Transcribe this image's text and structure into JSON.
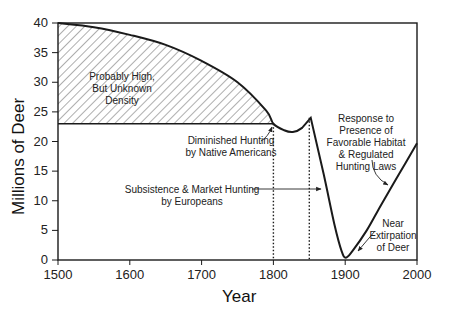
{
  "chart_data": {
    "type": "line",
    "title": "",
    "xlabel": "Year",
    "ylabel": "Millions of Deer",
    "xlim": [
      1500,
      2000
    ],
    "ylim": [
      0,
      40
    ],
    "x_ticks": [
      1500,
      1600,
      1700,
      1800,
      1900,
      2000
    ],
    "y_ticks": [
      0,
      5,
      10,
      15,
      20,
      25,
      30,
      35,
      40
    ],
    "grid": false,
    "series": [
      {
        "name": "Deer population",
        "x": [
          1500,
          1550,
          1600,
          1650,
          1700,
          1750,
          1790,
          1800,
          1815,
          1827,
          1840,
          1852,
          1870,
          1885,
          1895,
          1901,
          1910,
          1930,
          1950,
          1975,
          2000
        ],
        "values": [
          40,
          39.3,
          38,
          36.3,
          33.6,
          30,
          25.2,
          23,
          21.9,
          21.6,
          22.3,
          24,
          14.5,
          6,
          1.5,
          0.4,
          1.5,
          5,
          9.3,
          14.5,
          19.7
        ]
      },
      {
        "name": "Unknown-density upper bound (hatched region)",
        "x": [
          1500,
          1800
        ],
        "values": [
          23,
          23
        ]
      }
    ],
    "shaded_region": {
      "label": "Probably High, But Unknown Density",
      "x_range": [
        1500,
        1800
      ],
      "lower": 23,
      "upper": "population curve"
    },
    "vertical_markers": [
      1800,
      1850
    ],
    "annotations": [
      {
        "text": "Probably High, But Unknown Density",
        "lines": [
          "Probably High,",
          "But Unknown",
          "Density"
        ]
      },
      {
        "text": "Diminished Hunting by Native Americans",
        "lines": [
          "Diminished Hunting",
          "by Native Americans"
        ],
        "points_to_year": 1800
      },
      {
        "text": "Subsistence & Market Hunting by Europeans",
        "lines": [
          "Subsistence & Market Hunting",
          "by Europeans"
        ],
        "points_to_year": 1870
      },
      {
        "text": "Response to Presence of Favorable Habitat & Regulated Hunting Laws",
        "lines": [
          "Response to",
          "Presence of",
          "Favorable Habitat",
          "& Regulated",
          "Hunting Laws"
        ],
        "points_to_year": 1960
      },
      {
        "text": "Near Extirpation of Deer",
        "lines": [
          "Near",
          "Extirpation",
          "of Deer"
        ],
        "points_to_year": 1910
      }
    ]
  }
}
